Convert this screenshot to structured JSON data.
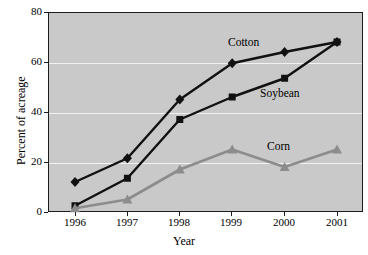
{
  "chart_data": {
    "type": "line",
    "title": "",
    "xlabel": "Year",
    "ylabel": "Percent of acreage",
    "categories": [
      "1996",
      "1997",
      "1998",
      "1999",
      "2000",
      "2001"
    ],
    "x": [
      1996,
      1997,
      1998,
      1999,
      2000,
      2001
    ],
    "xlim": [
      1995.7,
      2001.6
    ],
    "ylim": [
      0,
      80
    ],
    "yticks": [
      0,
      20,
      40,
      60,
      80
    ],
    "ytick_labels": [
      "0",
      "20",
      "40",
      "60",
      "80"
    ],
    "grid": "horizontal-white-gridlines-at-20-40-60",
    "legend_position": "inline-labels",
    "plot_background": "#c9c9c9",
    "series": [
      {
        "name": "Cotton",
        "values": [
          12,
          21.5,
          45,
          59.5,
          64,
          68
        ],
        "color": "#111111",
        "marker": "diamond",
        "label_text": "Cotton"
      },
      {
        "name": "Soybean",
        "values": [
          2.5,
          13.5,
          37,
          46,
          53.5,
          68
        ],
        "color": "#111111",
        "marker": "square",
        "label_text": "Soybean"
      },
      {
        "name": "Corn",
        "values": [
          1.5,
          5,
          17,
          25,
          18,
          25
        ],
        "color": "#8c8c8c",
        "marker": "triangle",
        "label_text": "Corn"
      }
    ]
  }
}
